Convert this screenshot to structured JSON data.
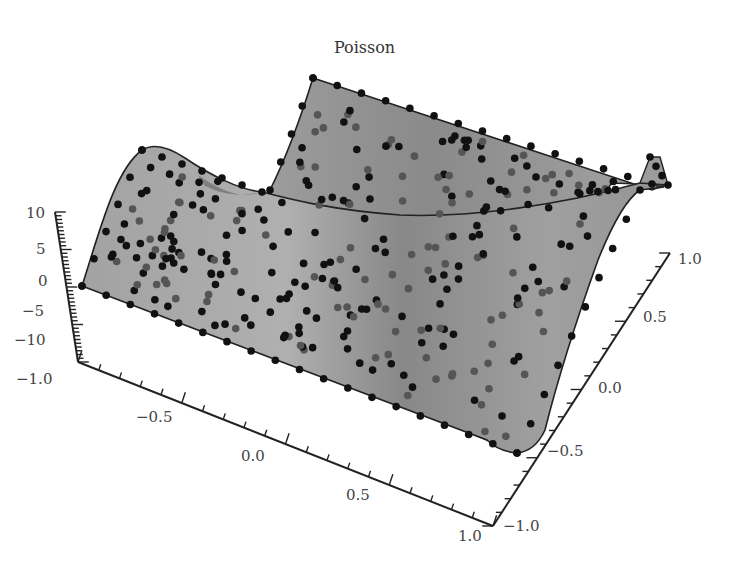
{
  "chart_data": {
    "type": "surface3d",
    "title": "Poisson",
    "xlabel": "",
    "ylabel": "",
    "zlabel": "",
    "xlim": [
      -1.0,
      1.0
    ],
    "ylim": [
      -1.0,
      1.0
    ],
    "zlim": [
      -10,
      10
    ],
    "x_ticks": [
      "-1.0",
      "-0.5",
      "0.0",
      "0.5",
      "1.0"
    ],
    "y_ticks": [
      "-1.0",
      "-0.5",
      "0.0",
      "0.5",
      "1.0"
    ],
    "z_ticks": [
      "10",
      "5",
      "0",
      "-5",
      "-10"
    ],
    "colors": {
      "surface": "#9a9a9a",
      "surface_light": "#b4b4b4",
      "surface_dark": "#7d7d7d",
      "node": "#111111",
      "node_hidden": "#555555",
      "axis": "#222222"
    }
  },
  "title": "Poisson",
  "axes": {
    "z": {
      "labels": [
        {
          "text": "10",
          "x": 26,
          "y": 204
        },
        {
          "text": "5",
          "x": 36,
          "y": 240
        },
        {
          "text": "0",
          "x": 38,
          "y": 272
        },
        {
          "text": "-5",
          "x": 22,
          "y": 302
        },
        {
          "text": "-10",
          "x": 14,
          "y": 331
        }
      ]
    },
    "x": {
      "labels": [
        {
          "text": "-1.0",
          "x": 16,
          "y": 370
        },
        {
          "text": "-0.5",
          "x": 136,
          "y": 408
        },
        {
          "text": "0.0",
          "x": 241,
          "y": 447
        },
        {
          "text": "0.5",
          "x": 346,
          "y": 486
        },
        {
          "text": "1.0",
          "x": 458,
          "y": 527
        }
      ]
    },
    "y": {
      "labels": [
        {
          "text": "-1.0",
          "x": 503,
          "y": 517
        },
        {
          "text": "-0.5",
          "x": 547,
          "y": 442
        },
        {
          "text": "0.0",
          "x": 598,
          "y": 379
        },
        {
          "text": "0.5",
          "x": 643,
          "y": 308
        },
        {
          "text": "1.0",
          "x": 678,
          "y": 250
        }
      ]
    }
  }
}
